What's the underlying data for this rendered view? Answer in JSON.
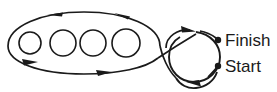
{
  "diagram": {
    "stroke_color": "#1a1a1a",
    "background_color": "#ffffff",
    "labels": {
      "finish": "Finish",
      "start": "Start"
    },
    "markers": {
      "finish_dot": "finish-point-dot",
      "start_dot": "start-point-dot"
    },
    "obstacles": {
      "count": 4,
      "shape": "circle",
      "items": [
        {
          "name": "obstacle-1",
          "cx": 30,
          "cy": 43,
          "r": 11
        },
        {
          "name": "obstacle-2",
          "cx": 63,
          "cy": 43,
          "r": 13
        },
        {
          "name": "obstacle-3",
          "cx": 93,
          "cy": 43,
          "r": 13
        },
        {
          "name": "obstacle-4",
          "cx": 126,
          "cy": 43,
          "r": 14
        }
      ]
    },
    "arrows": {
      "top_direction": "left",
      "bottom_direction": "right",
      "loop_top_direction": "right",
      "loop_bottom_direction": "left",
      "count": 6
    },
    "ellipse": {
      "cx": 84,
      "cy": 43,
      "rx": 78,
      "ry": 31
    },
    "loop_circle": {
      "cx": 192,
      "cy": 57,
      "r": 26
    }
  }
}
